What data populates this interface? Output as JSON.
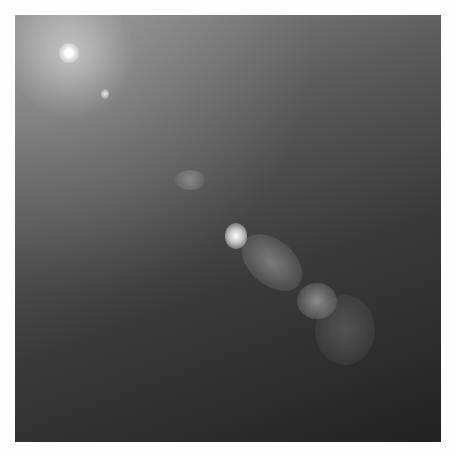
{
  "image": {
    "subject": "galaxy core with relativistic jet",
    "colors": {
      "frame": "#fefefe",
      "sky_top_left": "#8a8a8a",
      "sky_bottom_right": "#222222",
      "core": "#ffffff"
    }
  }
}
